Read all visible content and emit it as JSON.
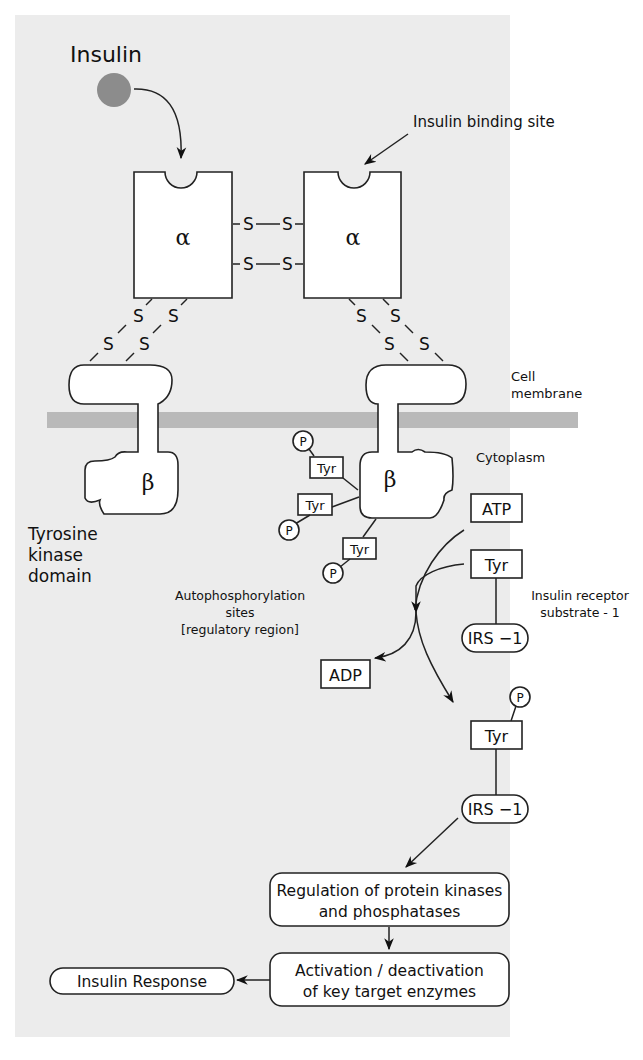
{
  "title": "Insulin",
  "labels": {
    "insulin": "Insulin",
    "binding_site": "Insulin binding site",
    "cell_membrane_1": "Cell",
    "cell_membrane_2": "membrane",
    "cytoplasm": "Cytoplasm",
    "tk_1": "Tyrosine",
    "tk_2": "kinase",
    "tk_3": "domain",
    "auto_1": "Autophosphorylation",
    "auto_2": "sites",
    "auto_3": "[regulatory region]",
    "irs_desc_1": "Insulin receptor",
    "irs_desc_2": "substrate - 1"
  },
  "subunits": {
    "alpha": "α",
    "beta": "β",
    "disulfide": "S"
  },
  "molecules": {
    "atp": "ATP",
    "adp": "ADP",
    "tyr": "Tyr",
    "p": "P",
    "irs1": "IRS −1"
  },
  "pathway": {
    "step1_line1": "Regulation of protein kinases",
    "step1_line2": "and phosphatases",
    "step2_line1": "Activation / deactivation",
    "step2_line2": "of key target enzymes",
    "response": "Insulin Response"
  },
  "colors": {
    "background": "#ececec",
    "membrane": "#b9b9b9",
    "insulin_ball": "#8c8c8c"
  }
}
